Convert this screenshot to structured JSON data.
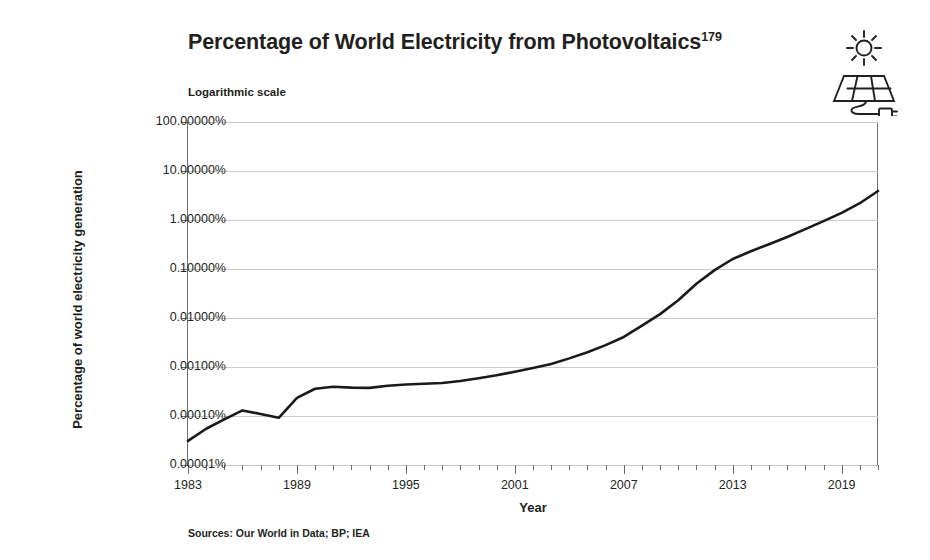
{
  "figure": {
    "title_main": "Percentage of World Electricity from Photovoltaics",
    "title_superscript": "179",
    "subtitle": "Logarithmic scale",
    "sources": "Sources: Our World in Data; BP; IEA",
    "icon_name": "solar-panel-sun-icon",
    "line_color": "#1a1a1a",
    "grid_color": "#c9cacb",
    "axis_color": "#6d6e71",
    "background": "#ffffff"
  },
  "chart_data": {
    "type": "line",
    "title": "Percentage of World Electricity from Photovoltaics",
    "subtitle": "Logarithmic scale",
    "xlabel": "Year",
    "ylabel": "Percentage of world electricity generation",
    "yscale": "log",
    "ylim": [
      1e-05,
      100
    ],
    "xlim": [
      1983,
      2021
    ],
    "grid": true,
    "legend": null,
    "ytick_labels": [
      "100.00000%",
      "10.00000%",
      "1.00000%",
      "0.10000%",
      "0.01000%",
      "0.00100%",
      "0.00010%",
      "0.00001%"
    ],
    "ytick_values": [
      100,
      10,
      1,
      0.1,
      0.01,
      0.001,
      0.0001,
      1e-05
    ],
    "xtick_labels": [
      "1983",
      "1989",
      "1995",
      "2001",
      "2007",
      "2013",
      "2019"
    ],
    "xtick_values": [
      1983,
      1989,
      1995,
      2001,
      2007,
      2013,
      2019
    ],
    "xtick_minor_step": 1,
    "series": [
      {
        "name": "Photovoltaics share of world electricity",
        "unit": "%",
        "x": [
          1983,
          1984,
          1985,
          1986,
          1987,
          1988,
          1989,
          1990,
          1991,
          1992,
          1993,
          1994,
          1995,
          1996,
          1997,
          1998,
          1999,
          2000,
          2001,
          2002,
          2003,
          2004,
          2005,
          2006,
          2007,
          2008,
          2009,
          2010,
          2011,
          2012,
          2013,
          2014,
          2015,
          2016,
          2017,
          2018,
          2019,
          2020,
          2021
        ],
        "values": [
          3.1e-05,
          5.5e-05,
          8.5e-05,
          0.00013,
          0.00011,
          9.2e-05,
          0.000235,
          0.00036,
          0.000395,
          0.00038,
          0.000375,
          0.000415,
          0.00044,
          0.000455,
          0.00047,
          0.00052,
          0.00059,
          0.00068,
          0.0008,
          0.00095,
          0.00115,
          0.0015,
          0.002,
          0.0028,
          0.0041,
          0.007,
          0.012,
          0.023,
          0.05,
          0.095,
          0.16,
          0.23,
          0.32,
          0.45,
          0.65,
          0.95,
          1.4,
          2.2,
          3.9
        ]
      }
    ]
  }
}
